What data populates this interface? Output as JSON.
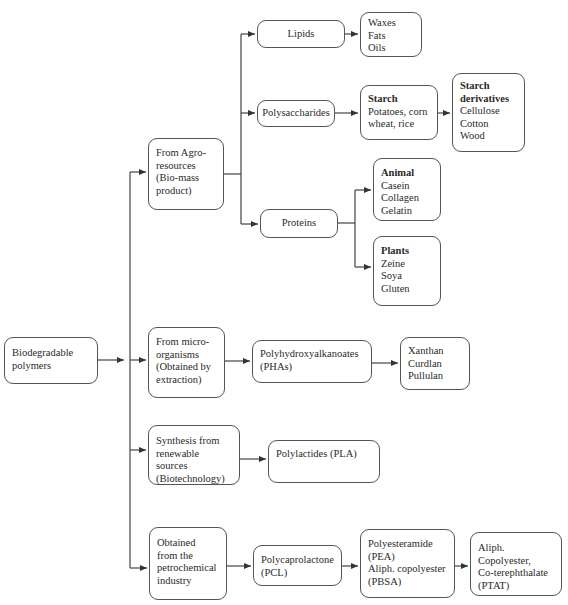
{
  "root": {
    "lines": [
      "Biodegradable",
      "polymers"
    ]
  },
  "sources": {
    "agro": {
      "lines": [
        "From Agro-",
        "resources",
        "(Bio-mass",
        "product)"
      ]
    },
    "micro": {
      "lines": [
        "From micro-",
        "organisms",
        "(Obtained by",
        "extraction)"
      ]
    },
    "synthesis": {
      "lines": [
        "Synthesis from",
        "renewable sources",
        "(Biotechnology)"
      ]
    },
    "petro": {
      "lines": [
        "Obtained",
        "from the",
        "petrochemical",
        "industry"
      ]
    }
  },
  "agro_children": {
    "lipids": {
      "label": "Lipids",
      "examples": [
        "Waxes",
        "Fats",
        "Oils"
      ]
    },
    "polysaccharides": {
      "label": "Polysaccharides",
      "starch": {
        "title": "Starch",
        "lines": [
          "Potatoes, corn",
          "wheat, rice"
        ]
      },
      "starch_derivatives": {
        "title_lines": [
          "Starch",
          "derivatives"
        ],
        "lines": [
          "Cellulose",
          "Cotton",
          "Wood"
        ]
      }
    },
    "proteins": {
      "label": "Proteins",
      "animal": {
        "title": "Animal",
        "lines": [
          "Casein",
          "Collagen",
          "Gelatin"
        ]
      },
      "plants": {
        "title": "Plants",
        "lines": [
          "Zeine",
          "Soya",
          "Gluten"
        ]
      }
    }
  },
  "micro_children": {
    "pha": {
      "lines": [
        "Polyhydroxyalkanoates",
        "(PHAs)"
      ]
    },
    "pha_examples": {
      "lines": [
        "Xanthan",
        "Curdlan",
        "Pullulan"
      ]
    }
  },
  "synthesis_children": {
    "pla": {
      "lines": [
        "Polylactides (PLA)"
      ]
    }
  },
  "petro_children": {
    "pcl": {
      "lines": [
        "Polycaprolactone",
        "(PCL)"
      ]
    },
    "pea": {
      "lines": [
        "Polyesteramide",
        "(PEA)",
        "Aliph. copolyester",
        "(PBSA)"
      ]
    },
    "ptat": {
      "lines": [
        "Aliph.",
        "Copolyester,",
        "Co-terephthalate",
        "(PTAT)"
      ]
    }
  },
  "style": {
    "line_color": "#444444",
    "border_color": "#555555",
    "background": "#fefefe"
  }
}
